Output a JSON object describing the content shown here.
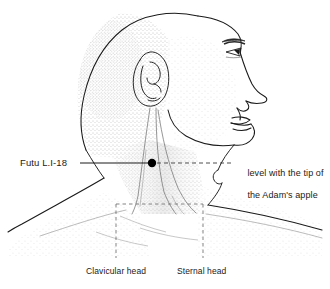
{
  "figure": {
    "type": "anatomical-line-illustration",
    "view": "lateral head and neck, facing right",
    "background_color": "#ffffff",
    "ink_color": "#1a1a1a"
  },
  "labels": {
    "point": {
      "text": "Futu L.I-18",
      "position": "left",
      "leader": "solid horizontal line to point marker"
    },
    "level": {
      "line1": "level with the tip of",
      "line2": "the Adam's apple",
      "position": "right",
      "leader": "dashed horizontal line from point marker"
    },
    "clavicular_head": {
      "text": "Clavicular head",
      "position": "bottom-left",
      "leader": "dashed vertical line"
    },
    "sternal_head": {
      "text": "Sternal head",
      "position": "bottom-right",
      "leader": "dashed vertical line"
    }
  },
  "point_marker": {
    "name": "Futu L.I-18",
    "cx": 152,
    "cy": 163,
    "radius": 4.2,
    "color": "#000000"
  },
  "leader_lines": {
    "solid_left": {
      "x1": 80,
      "y1": 163,
      "x2": 148,
      "y2": 163
    },
    "dashed_right": {
      "x1": 157,
      "y1": 163,
      "x2": 234,
      "y2": 163
    }
  },
  "dashed_box": {
    "x": 116,
    "y": 204,
    "width": 87,
    "height": 54,
    "note": "highlights sternocleidomastoid heads"
  }
}
